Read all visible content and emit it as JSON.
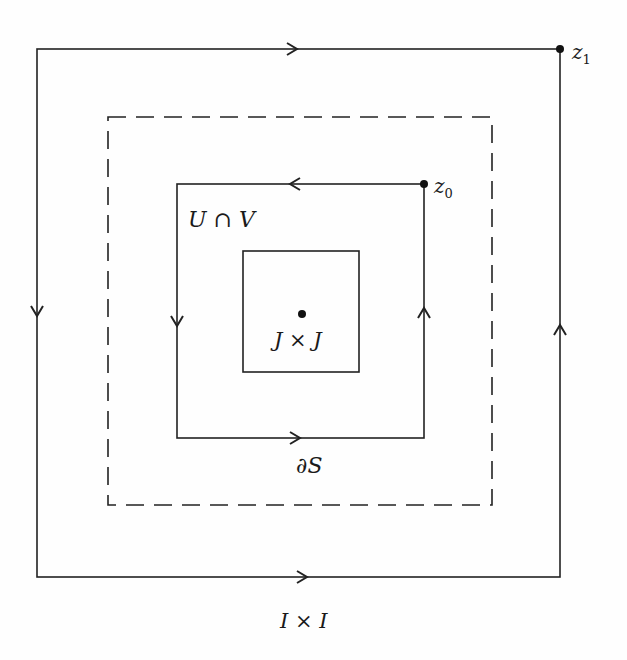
{
  "diagram": {
    "labels": {
      "z1": "z",
      "z1_sub": "1",
      "z0": "z",
      "z0_sub": "0",
      "u_cap_v": "U ∩ V",
      "j_x_j": "J × J",
      "boundary_s": "∂S",
      "i_x_i": "I × I"
    },
    "colors": {
      "stroke": "#222222",
      "background": "#fefefe"
    },
    "shapes": {
      "outer_square": {
        "x1": 37,
        "y1": 49,
        "x2": 560,
        "y2": 577,
        "style": "solid"
      },
      "dashed_square": {
        "x1": 108,
        "y1": 117,
        "x2": 492,
        "y2": 505,
        "style": "dashed"
      },
      "inner_square": {
        "x1": 177,
        "y1": 184,
        "x2": 424,
        "y2": 438,
        "style": "solid"
      },
      "small_square": {
        "x1": 243,
        "y1": 251,
        "x2": 359,
        "y2": 372,
        "style": "solid"
      }
    }
  }
}
